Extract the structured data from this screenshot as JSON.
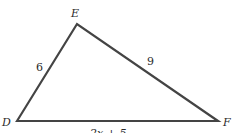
{
  "diagram": {
    "type": "triangle",
    "vertices": {
      "D": {
        "label": "D",
        "x": 17,
        "y": 121
      },
      "E": {
        "label": "E",
        "x": 77,
        "y": 24
      },
      "F": {
        "label": "F",
        "x": 218,
        "y": 121
      }
    },
    "sides": {
      "DE": {
        "label": "6"
      },
      "EF": {
        "label": "9"
      },
      "DF": {
        "label": "2x + 5"
      }
    },
    "colors": {
      "stroke": "#444444",
      "text": "#2a2a2a"
    }
  }
}
